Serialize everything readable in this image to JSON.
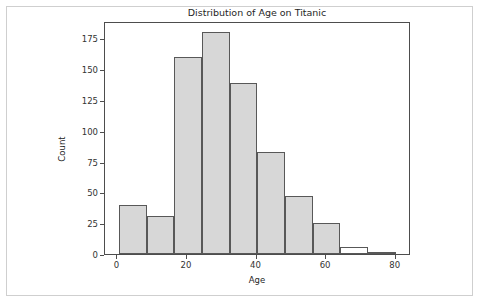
{
  "chart_data": {
    "type": "bar",
    "title": "Distribution of Age on Titanic",
    "xlabel": "Age",
    "ylabel": "Count",
    "grid": false,
    "legend": null,
    "xlim": [
      -3.56,
      84.4
    ],
    "ylim": [
      0,
      189
    ],
    "xticks": [
      0,
      20,
      40,
      60,
      80
    ],
    "xtick_labels": [
      "0",
      "20",
      "40",
      "60",
      "80"
    ],
    "yticks": [
      0,
      25,
      50,
      75,
      100,
      125,
      150,
      175
    ],
    "ytick_labels": [
      "0",
      "25",
      "50",
      "75",
      "100",
      "125",
      "150",
      "175"
    ],
    "bin_edges": [
      0.42,
      8.38,
      16.34,
      24.29,
      32.25,
      40.21,
      48.17,
      56.13,
      64.08,
      72.04,
      80.0
    ],
    "categories": [
      "0.42-8.38",
      "8.38-16.34",
      "16.34-24.29",
      "24.29-32.25",
      "32.25-40.21",
      "40.21-48.17",
      "48.17-56.13",
      "56.13-64.08",
      "64.08-72.04",
      "72.04-80.00"
    ],
    "values": [
      40,
      31,
      160,
      180,
      139,
      83,
      47,
      25,
      6,
      1
    ],
    "bar_fill_color": "#d7d7d7",
    "bar_edge_color": "#585858",
    "axes_edge_color": "#4d4d4d",
    "figure_border_color": "#cfcfcf",
    "background_color": "#ffffff"
  }
}
